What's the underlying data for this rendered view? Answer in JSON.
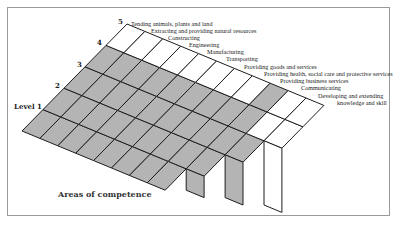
{
  "levels": {
    "l1": "Level 1",
    "l2": "2",
    "l3": "3",
    "l4": "4",
    "l5": "5"
  },
  "areas": [
    "Tending animals, plants and land",
    "Extracting and providing natural resources",
    "Constructing",
    "Engineering",
    "Manufacturing",
    "Transporting",
    "Providing goods and services",
    "Providing health, social care and protective services",
    "Providing business services",
    "Communicating",
    "Developing and extending",
    "knowledge and skill"
  ],
  "axis_title": "Areas of competence",
  "colors": {
    "shaded": "#b4b4b4",
    "unshaded": "#ffffff",
    "line": "#1e1e1e",
    "frame": "#9a9a9a"
  }
}
